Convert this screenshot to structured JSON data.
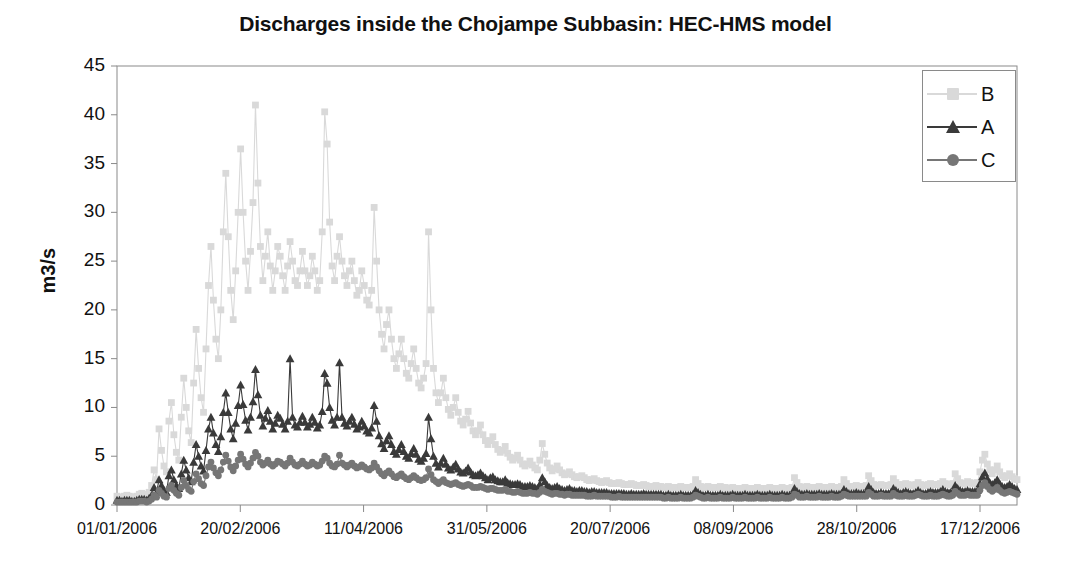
{
  "chart_data": {
    "type": "line",
    "title": "Discharges inside the Chojampe Subbasin:  HEC-HMS model",
    "xlabel": "",
    "ylabel": "m3/s",
    "ylim": [
      0,
      45
    ],
    "yticks": [
      0,
      5,
      10,
      15,
      20,
      25,
      30,
      35,
      40,
      45
    ],
    "xticks": [
      "01/01/2006",
      "20/02/2006",
      "11/04/2006",
      "31/05/2006",
      "20/07/2006",
      "08/09/2006",
      "28/10/2006",
      "17/12/2006"
    ],
    "xtick_day_index": [
      0,
      50,
      100,
      150,
      200,
      250,
      300,
      350
    ],
    "x_range_days": [
      0,
      365
    ],
    "grid": false,
    "legend_position": "top-right",
    "colors": {
      "B": "#d9d9d9",
      "A": "#3a3a3a",
      "C": "#767676",
      "axis": "#8a8a8a",
      "text": "#111111"
    },
    "series": [
      {
        "name": "B",
        "marker": "square",
        "color": "#d9d9d9",
        "values": [
          0.9,
          0.8,
          0.8,
          0.9,
          1.0,
          0.9,
          0.8,
          0.8,
          0.9,
          1.1,
          1.2,
          1.1,
          1.0,
          1.3,
          2.0,
          3.6,
          2.6,
          7.8,
          5.6,
          4.0,
          3.4,
          8.6,
          10.5,
          7.2,
          5.4,
          4.6,
          9.0,
          13.0,
          10.0,
          7.6,
          6.4,
          12.5,
          18.0,
          14.0,
          11.0,
          9.5,
          16.0,
          22.5,
          26.5,
          21.0,
          17.0,
          15.0,
          20.0,
          28.0,
          34.0,
          27.5,
          22.0,
          19.0,
          24.0,
          30.0,
          36.5,
          30.0,
          25.0,
          22.0,
          26.0,
          31.0,
          41.0,
          33.0,
          26.5,
          23.0,
          25.5,
          28.0,
          24.5,
          22.0,
          24.0,
          26.5,
          25.5,
          23.5,
          22.0,
          24.5,
          27.0,
          25.0,
          23.0,
          22.5,
          24.0,
          26.0,
          24.0,
          22.5,
          23.5,
          25.5,
          24.0,
          22.0,
          23.0,
          28.0,
          40.3,
          37.0,
          29.0,
          24.5,
          23.0,
          25.5,
          27.5,
          25.0,
          23.5,
          22.5,
          24.0,
          25.0,
          23.0,
          21.5,
          22.0,
          24.0,
          22.5,
          21.0,
          20.5,
          22.0,
          30.5,
          25.0,
          20.0,
          17.5,
          16.0,
          18.5,
          20.0,
          17.0,
          15.0,
          14.0,
          15.5,
          17.0,
          15.0,
          13.5,
          13.0,
          14.5,
          16.0,
          14.0,
          12.5,
          12.0,
          13.0,
          14.5,
          28.0,
          20.0,
          14.0,
          11.5,
          10.5,
          11.5,
          13.0,
          11.0,
          9.8,
          9.2,
          10.0,
          11.0,
          9.5,
          8.6,
          8.2,
          8.8,
          9.6,
          8.4,
          7.6,
          7.2,
          7.6,
          8.2,
          7.2,
          6.6,
          6.2,
          6.6,
          7.0,
          6.2,
          5.7,
          5.4,
          5.6,
          6.0,
          5.3,
          4.9,
          4.6,
          4.8,
          5.1,
          4.6,
          4.2,
          4.0,
          4.2,
          4.5,
          4.1,
          3.8,
          3.6,
          4.6,
          6.3,
          5.2,
          4.3,
          3.8,
          3.5,
          3.7,
          4.0,
          3.6,
          3.3,
          3.1,
          3.2,
          3.4,
          3.1,
          2.9,
          2.8,
          2.9,
          3.0,
          2.8,
          2.6,
          2.5,
          2.6,
          2.7,
          2.5,
          2.4,
          2.3,
          2.4,
          2.5,
          2.3,
          2.2,
          2.2,
          2.2,
          2.3,
          2.2,
          2.1,
          2.1,
          2.1,
          2.2,
          2.1,
          2.0,
          2.0,
          2.0,
          2.1,
          2.0,
          1.9,
          1.9,
          1.9,
          2.0,
          1.9,
          1.9,
          1.8,
          1.8,
          1.9,
          1.8,
          1.8,
          1.8,
          1.8,
          1.9,
          1.8,
          1.8,
          1.8,
          1.8,
          1.9,
          2.6,
          2.2,
          1.9,
          1.8,
          1.8,
          1.9,
          1.8,
          1.8,
          1.8,
          1.8,
          1.9,
          1.8,
          1.8,
          1.7,
          1.7,
          1.8,
          1.7,
          1.7,
          1.7,
          1.7,
          1.8,
          1.7,
          1.7,
          1.7,
          1.7,
          1.8,
          1.7,
          1.7,
          1.7,
          1.7,
          1.8,
          1.7,
          1.7,
          1.7,
          1.7,
          1.8,
          1.7,
          1.7,
          1.7,
          1.8,
          2.8,
          2.3,
          1.9,
          1.8,
          1.8,
          1.9,
          1.8,
          1.8,
          1.8,
          1.8,
          1.9,
          1.8,
          1.8,
          1.8,
          1.8,
          1.9,
          1.8,
          1.8,
          1.8,
          1.9,
          2.6,
          2.2,
          1.9,
          1.9,
          1.9,
          2.0,
          1.9,
          1.9,
          1.9,
          2.0,
          3.0,
          2.5,
          2.1,
          2.0,
          2.0,
          2.1,
          2.0,
          2.0,
          2.0,
          2.1,
          2.7,
          2.3,
          2.1,
          2.0,
          2.1,
          2.2,
          2.1,
          2.0,
          2.0,
          2.1,
          2.3,
          2.1,
          2.0,
          2.0,
          2.1,
          2.2,
          2.1,
          2.1,
          2.1,
          2.2,
          2.4,
          2.2,
          2.1,
          2.1,
          2.2,
          3.2,
          2.7,
          2.3,
          2.2,
          2.2,
          2.4,
          2.3,
          2.2,
          2.2,
          2.3,
          3.4,
          4.6,
          5.2,
          4.2,
          3.6,
          3.2,
          3.6,
          4.0,
          3.4,
          3.0,
          2.8,
          3.0,
          3.2,
          2.9,
          2.7,
          2.6
        ]
      },
      {
        "name": "A",
        "marker": "triangle",
        "color": "#3a3a3a",
        "values": [
          0.5,
          0.5,
          0.4,
          0.5,
          0.5,
          0.5,
          0.4,
          0.4,
          0.5,
          0.6,
          0.6,
          0.6,
          0.5,
          0.7,
          1.0,
          1.8,
          1.3,
          2.6,
          2.0,
          1.5,
          1.3,
          3.0,
          3.6,
          2.6,
          2.0,
          1.7,
          3.2,
          4.6,
          3.6,
          2.8,
          2.4,
          4.4,
          6.2,
          5.0,
          4.0,
          3.5,
          5.6,
          7.8,
          9.0,
          7.4,
          6.2,
          5.5,
          7.0,
          9.5,
          11.5,
          9.5,
          7.8,
          6.8,
          8.4,
          10.2,
          12.3,
          10.3,
          8.7,
          7.7,
          9.0,
          10.6,
          13.9,
          11.3,
          9.2,
          8.1,
          8.9,
          9.7,
          8.6,
          7.8,
          8.4,
          9.2,
          8.9,
          8.3,
          7.8,
          8.6,
          15.0,
          9.0,
          8.2,
          8.0,
          8.5,
          9.1,
          8.5,
          8.0,
          8.3,
          9.0,
          8.5,
          7.9,
          8.2,
          9.6,
          13.5,
          12.5,
          10.0,
          8.7,
          8.2,
          9.0,
          14.6,
          9.0,
          8.4,
          8.1,
          8.6,
          9.0,
          8.3,
          7.8,
          8.0,
          8.6,
          8.1,
          7.6,
          7.4,
          7.9,
          10.2,
          8.6,
          7.1,
          6.3,
          5.8,
          6.6,
          7.1,
          6.2,
          5.5,
          5.2,
          5.7,
          6.2,
          5.5,
          5.0,
          4.8,
          5.3,
          5.8,
          5.2,
          4.7,
          4.5,
          4.8,
          5.3,
          9.0,
          6.8,
          5.0,
          4.3,
          3.9,
          4.3,
          4.8,
          4.2,
          3.8,
          3.6,
          3.9,
          4.2,
          3.7,
          3.4,
          3.3,
          3.5,
          3.8,
          3.4,
          3.1,
          3.0,
          3.1,
          3.3,
          3.0,
          2.8,
          2.6,
          2.8,
          2.9,
          2.6,
          2.5,
          2.4,
          2.4,
          2.6,
          2.3,
          2.2,
          2.1,
          2.1,
          2.2,
          2.1,
          1.9,
          1.9,
          1.9,
          2.0,
          1.9,
          1.8,
          1.7,
          2.1,
          2.8,
          2.4,
          2.0,
          1.8,
          1.7,
          1.8,
          1.9,
          1.7,
          1.6,
          1.5,
          1.6,
          1.7,
          1.5,
          1.5,
          1.4,
          1.5,
          1.5,
          1.4,
          1.4,
          1.3,
          1.4,
          1.4,
          1.3,
          1.3,
          1.3,
          1.3,
          1.3,
          1.2,
          1.2,
          1.2,
          1.2,
          1.2,
          1.2,
          1.2,
          1.1,
          1.1,
          1.2,
          1.1,
          1.1,
          1.1,
          1.1,
          1.2,
          1.1,
          1.1,
          1.1,
          1.1,
          1.1,
          1.1,
          1.1,
          1.0,
          1.0,
          1.1,
          1.0,
          1.0,
          1.0,
          1.0,
          1.1,
          1.0,
          1.0,
          1.0,
          1.0,
          1.1,
          1.5,
          1.3,
          1.1,
          1.0,
          1.0,
          1.1,
          1.0,
          1.0,
          1.0,
          1.0,
          1.1,
          1.0,
          1.0,
          1.0,
          1.0,
          1.1,
          1.0,
          1.0,
          1.0,
          1.0,
          1.1,
          1.0,
          1.0,
          1.0,
          1.0,
          1.1,
          1.0,
          1.0,
          1.0,
          1.0,
          1.1,
          1.0,
          1.0,
          1.0,
          1.0,
          1.1,
          1.0,
          1.0,
          1.0,
          1.1,
          1.7,
          1.4,
          1.2,
          1.1,
          1.1,
          1.2,
          1.1,
          1.1,
          1.1,
          1.1,
          1.2,
          1.1,
          1.1,
          1.1,
          1.1,
          1.2,
          1.1,
          1.1,
          1.1,
          1.2,
          1.6,
          1.4,
          1.2,
          1.2,
          1.2,
          1.3,
          1.2,
          1.2,
          1.2,
          1.3,
          1.9,
          1.6,
          1.3,
          1.2,
          1.2,
          1.3,
          1.2,
          1.2,
          1.2,
          1.3,
          1.7,
          1.5,
          1.3,
          1.2,
          1.3,
          1.4,
          1.3,
          1.2,
          1.2,
          1.3,
          1.5,
          1.3,
          1.2,
          1.2,
          1.3,
          1.4,
          1.3,
          1.3,
          1.3,
          1.4,
          1.6,
          1.4,
          1.3,
          1.3,
          1.4,
          2.0,
          1.7,
          1.5,
          1.4,
          1.4,
          1.5,
          1.4,
          1.4,
          1.4,
          1.5,
          2.2,
          2.9,
          3.3,
          2.7,
          2.3,
          2.1,
          2.3,
          2.6,
          2.2,
          1.9,
          1.8,
          1.9,
          2.1,
          1.9,
          1.7,
          1.6
        ]
      },
      {
        "name": "C",
        "marker": "circle",
        "color": "#767676",
        "values": [
          0.3,
          0.3,
          0.3,
          0.3,
          0.3,
          0.3,
          0.3,
          0.3,
          0.3,
          0.4,
          0.4,
          0.4,
          0.3,
          0.4,
          0.6,
          1.0,
          0.8,
          1.5,
          1.2,
          0.9,
          0.8,
          1.7,
          2.0,
          1.5,
          1.2,
          1.0,
          1.8,
          2.5,
          2.0,
          1.6,
          1.4,
          2.4,
          3.2,
          2.7,
          2.2,
          2.0,
          3.0,
          3.9,
          4.4,
          3.8,
          3.3,
          3.0,
          3.6,
          4.4,
          5.1,
          4.5,
          3.9,
          3.5,
          4.0,
          4.6,
          5.2,
          4.7,
          4.2,
          3.9,
          4.3,
          4.8,
          5.4,
          5.0,
          4.4,
          4.1,
          4.3,
          4.6,
          4.2,
          4.0,
          4.2,
          4.5,
          4.4,
          4.2,
          4.0,
          4.3,
          4.8,
          4.4,
          4.1,
          4.0,
          4.2,
          4.5,
          4.2,
          4.0,
          4.1,
          4.4,
          4.2,
          4.0,
          4.1,
          4.5,
          5.0,
          4.8,
          4.3,
          4.0,
          3.9,
          4.2,
          5.1,
          4.3,
          4.1,
          3.9,
          4.1,
          4.3,
          4.0,
          3.8,
          3.9,
          4.1,
          3.9,
          3.7,
          3.6,
          3.8,
          4.3,
          3.9,
          3.5,
          3.2,
          3.0,
          3.3,
          3.5,
          3.2,
          2.9,
          2.8,
          3.0,
          3.2,
          2.9,
          2.7,
          2.6,
          2.8,
          3.0,
          2.8,
          2.6,
          2.5,
          2.6,
          2.8,
          3.7,
          3.1,
          2.6,
          2.4,
          2.2,
          2.4,
          2.6,
          2.3,
          2.2,
          2.1,
          2.2,
          2.3,
          2.1,
          2.0,
          1.9,
          2.0,
          2.1,
          2.0,
          1.8,
          1.8,
          1.8,
          1.9,
          1.8,
          1.7,
          1.6,
          1.7,
          1.7,
          1.6,
          1.5,
          1.5,
          1.5,
          1.6,
          1.4,
          1.4,
          1.3,
          1.3,
          1.4,
          1.3,
          1.2,
          1.2,
          1.2,
          1.3,
          1.2,
          1.2,
          1.1,
          1.3,
          1.6,
          1.4,
          1.3,
          1.2,
          1.1,
          1.2,
          1.2,
          1.1,
          1.1,
          1.0,
          1.1,
          1.1,
          1.0,
          1.0,
          1.0,
          1.0,
          1.0,
          1.0,
          0.9,
          0.9,
          0.9,
          1.0,
          0.9,
          0.9,
          0.9,
          0.9,
          0.9,
          0.9,
          0.8,
          0.8,
          0.8,
          0.9,
          0.8,
          0.8,
          0.8,
          0.8,
          0.8,
          0.8,
          0.8,
          0.8,
          0.8,
          0.8,
          0.8,
          0.8,
          0.8,
          0.8,
          0.8,
          0.8,
          0.8,
          0.7,
          0.7,
          0.8,
          0.7,
          0.7,
          0.7,
          0.7,
          0.8,
          0.7,
          0.7,
          0.7,
          0.7,
          0.8,
          1.0,
          0.9,
          0.8,
          0.7,
          0.7,
          0.8,
          0.7,
          0.7,
          0.7,
          0.7,
          0.8,
          0.7,
          0.7,
          0.7,
          0.7,
          0.8,
          0.7,
          0.7,
          0.7,
          0.7,
          0.8,
          0.7,
          0.7,
          0.7,
          0.7,
          0.8,
          0.7,
          0.7,
          0.7,
          0.7,
          0.8,
          0.7,
          0.7,
          0.7,
          0.7,
          0.8,
          0.7,
          0.7,
          0.7,
          0.8,
          1.1,
          1.0,
          0.8,
          0.8,
          0.8,
          0.9,
          0.8,
          0.8,
          0.8,
          0.8,
          0.9,
          0.8,
          0.8,
          0.8,
          0.8,
          0.9,
          0.8,
          0.8,
          0.8,
          0.9,
          1.1,
          1.0,
          0.9,
          0.9,
          0.9,
          0.9,
          0.9,
          0.9,
          0.9,
          0.9,
          1.3,
          1.1,
          0.9,
          0.9,
          0.9,
          1.0,
          0.9,
          0.9,
          0.9,
          0.9,
          1.2,
          1.0,
          0.9,
          0.9,
          0.9,
          1.0,
          0.9,
          0.9,
          0.9,
          1.0,
          1.1,
          1.0,
          0.9,
          0.9,
          0.9,
          1.0,
          0.9,
          0.9,
          0.9,
          1.0,
          1.1,
          1.0,
          0.9,
          0.9,
          1.0,
          1.4,
          1.2,
          1.0,
          1.0,
          1.0,
          1.1,
          1.0,
          1.0,
          1.0,
          1.0,
          1.5,
          2.0,
          2.3,
          1.9,
          1.6,
          1.4,
          1.6,
          1.8,
          1.5,
          1.3,
          1.2,
          1.3,
          1.4,
          1.3,
          1.2,
          1.1
        ]
      }
    ],
    "legend": [
      {
        "label": "B",
        "marker": "square",
        "color": "#d9d9d9"
      },
      {
        "label": "A",
        "marker": "triangle",
        "color": "#3a3a3a"
      },
      {
        "label": "C",
        "marker": "circle",
        "color": "#767676"
      }
    ]
  }
}
